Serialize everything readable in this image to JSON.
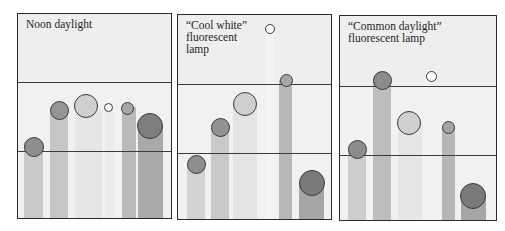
{
  "panels": [
    {
      "title": "Noon daylight",
      "box": {
        "left": 17,
        "top": 13,
        "width": 155,
        "height": 206
      },
      "lines_y": [
        68,
        137
      ],
      "bars": [
        {
          "x": 6,
          "w": 19,
          "top": 128,
          "color": "#c9c9c9"
        },
        {
          "x": 32,
          "w": 18,
          "top": 99,
          "color": "#c6c6c6"
        },
        {
          "x": 57,
          "w": 27,
          "top": 95,
          "color": "#e6e6e6"
        },
        {
          "x": 87,
          "w": 10,
          "top": 98,
          "color": "#ececec"
        },
        {
          "x": 104,
          "w": 14,
          "top": 93,
          "color": "#b9b9b9"
        },
        {
          "x": 120,
          "w": 25,
          "top": 112,
          "color": "#a9a9a9"
        }
      ],
      "dots": [
        {
          "cx": 16,
          "cy": 133,
          "d": 20,
          "color": "#8e8e8e"
        },
        {
          "cx": 41,
          "cy": 96,
          "d": 19,
          "color": "#959595"
        },
        {
          "cx": 68,
          "cy": 92,
          "d": 24,
          "color": "#cfcfcf"
        },
        {
          "cx": 90,
          "cy": 93,
          "d": 9,
          "color": "#ffffff"
        },
        {
          "cx": 109,
          "cy": 94,
          "d": 13,
          "color": "#a5a5a5"
        },
        {
          "cx": 132,
          "cy": 112,
          "d": 26,
          "color": "#7e7e7e"
        }
      ]
    },
    {
      "title": "“Cool white”\nfluorescent\nlamp",
      "box": {
        "left": 177,
        "top": 14,
        "width": 155,
        "height": 206
      },
      "lines_y": [
        69,
        138
      ],
      "bars": [
        {
          "x": 9,
          "w": 18,
          "top": 149,
          "color": "#d2d2d2"
        },
        {
          "x": 33,
          "w": 18,
          "top": 113,
          "color": "#c9c9c9"
        },
        {
          "x": 55,
          "w": 24,
          "top": 89,
          "color": "#e4e4e4"
        },
        {
          "x": 88,
          "w": 8,
          "top": 16,
          "color": "#f4f4f4"
        },
        {
          "x": 101,
          "w": 13,
          "top": 65,
          "color": "#b7b7b7"
        },
        {
          "x": 121,
          "w": 25,
          "top": 168,
          "color": "#a6a6a6"
        }
      ],
      "dots": [
        {
          "cx": 18,
          "cy": 149,
          "d": 19,
          "color": "#8e8e8e"
        },
        {
          "cx": 42,
          "cy": 112,
          "d": 19,
          "color": "#939393"
        },
        {
          "cx": 67,
          "cy": 89,
          "d": 24,
          "color": "#cfcfcf"
        },
        {
          "cx": 92,
          "cy": 14,
          "d": 10,
          "color": "#ffffff"
        },
        {
          "cx": 108,
          "cy": 65,
          "d": 13,
          "color": "#a6a6a6"
        },
        {
          "cx": 134,
          "cy": 168,
          "d": 26,
          "color": "#7a7a7a"
        }
      ]
    },
    {
      "title": "“Common daylight”\nfluorescent lamp",
      "box": {
        "left": 339,
        "top": 15,
        "width": 158,
        "height": 206
      },
      "lines_y": [
        70,
        139
      ],
      "bars": [
        {
          "x": 8,
          "w": 18,
          "top": 133,
          "color": "#cdcdcd"
        },
        {
          "x": 33,
          "w": 18,
          "top": 65,
          "color": "#bdbdbd"
        },
        {
          "x": 58,
          "w": 24,
          "top": 108,
          "color": "#e6e6e6"
        },
        {
          "x": 84,
          "w": 8,
          "top": 62,
          "color": "#f2f2f2"
        },
        {
          "x": 102,
          "w": 13,
          "top": 111,
          "color": "#b6b6b6"
        },
        {
          "x": 121,
          "w": 25,
          "top": 180,
          "color": "#a6a6a6"
        }
      ],
      "dots": [
        {
          "cx": 17,
          "cy": 133,
          "d": 19,
          "color": "#8c8c8c"
        },
        {
          "cx": 42,
          "cy": 64,
          "d": 19,
          "color": "#8b8b8b"
        },
        {
          "cx": 69,
          "cy": 107,
          "d": 24,
          "color": "#cfcfcf"
        },
        {
          "cx": 91,
          "cy": 60,
          "d": 11,
          "color": "#ffffff"
        },
        {
          "cx": 108,
          "cy": 111,
          "d": 13,
          "color": "#a3a3a3"
        },
        {
          "cx": 133,
          "cy": 180,
          "d": 26,
          "color": "#7a7a7a"
        }
      ]
    }
  ]
}
